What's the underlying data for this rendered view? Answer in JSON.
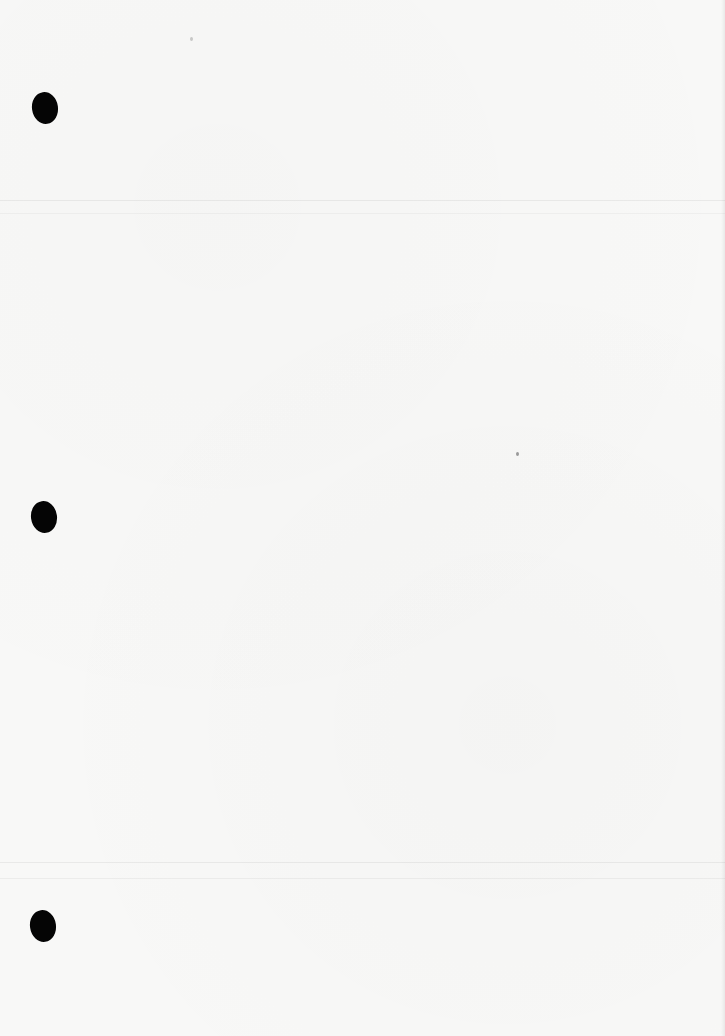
{
  "document": {
    "type": "blank scanned page",
    "text": "",
    "punch_holes": [
      {
        "x": 45,
        "y": 108
      },
      {
        "x": 44,
        "y": 517
      },
      {
        "x": 43,
        "y": 926
      }
    ],
    "rules_y": [
      200,
      213,
      862,
      878
    ],
    "colors": {
      "paper": "#f8f8f7",
      "hole": "#050505"
    }
  }
}
